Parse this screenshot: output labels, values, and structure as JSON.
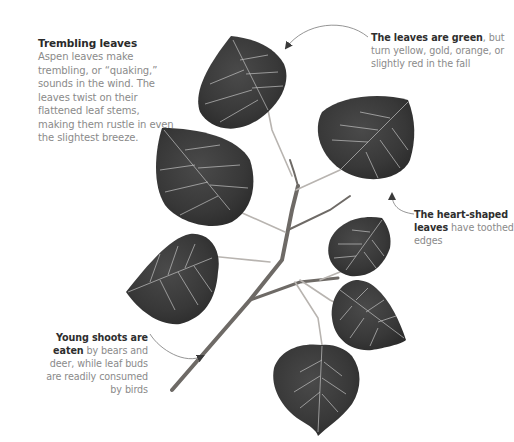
{
  "intro": {
    "title": "Trembling leaves",
    "body": "Aspen leaves make trembling, or “quaking,” sounds in the wind. The leaves twist on their flattened leaf stems, making them rustle in even the slightest breeze."
  },
  "annotations": {
    "color": {
      "bold": "The leaves are green",
      "rest": ", but turn yellow, gold, orange, or slightly red in the fall"
    },
    "shape": {
      "bold": "The heart-shaped leaves",
      "rest": " have toothed edges"
    },
    "shoots": {
      "bold": "Young shoots are eaten",
      "rest": " by bears and deer, while leaf buds are readily consumed by birds"
    }
  },
  "colors": {
    "leaf": "#3c3c3c",
    "vein": "#c9c9c9",
    "branch": "#6e6a66",
    "leader_line": "#7a7a7a",
    "bold_text": "#2e2e2e",
    "body_text": "#8a8a8a"
  },
  "icons": [
    "aspen-branch-illustration",
    "leader-arrow"
  ]
}
